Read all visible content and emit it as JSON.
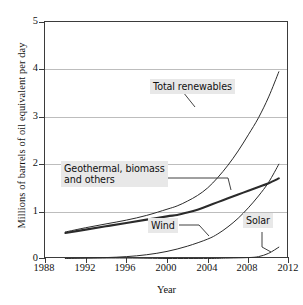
{
  "chart_data": {
    "type": "line",
    "title": "",
    "xlabel": "Year",
    "ylabel": "Millions of barrels of oil equivalent per day",
    "xlim": [
      1988,
      2012
    ],
    "ylim": [
      0,
      5
    ],
    "xticks": [
      1988,
      1992,
      1996,
      2000,
      2004,
      2008,
      2012
    ],
    "yticks": [
      0,
      1,
      2,
      3,
      4,
      5
    ],
    "grid": "horizontal",
    "legend": "inline-annotations",
    "series": [
      {
        "name": "Total renewables",
        "style": "thin",
        "x": [
          1990,
          1992,
          1994,
          1996,
          1998,
          2000,
          2001,
          2002,
          2003,
          2004,
          2005,
          2006,
          2007,
          2008,
          2009,
          2010,
          2011
        ],
        "values": [
          0.57,
          0.66,
          0.74,
          0.82,
          0.92,
          1.05,
          1.12,
          1.22,
          1.34,
          1.5,
          1.72,
          1.98,
          2.28,
          2.62,
          2.98,
          3.42,
          3.95
        ]
      },
      {
        "name": "Geothermal, biomass and others",
        "style": "thick",
        "x": [
          1990,
          1992,
          1994,
          1996,
          1998,
          2000,
          2001,
          2002,
          2003,
          2004,
          2005,
          2006,
          2007,
          2008,
          2009,
          2010,
          2011
        ],
        "values": [
          0.55,
          0.62,
          0.69,
          0.76,
          0.83,
          0.9,
          0.93,
          0.98,
          1.04,
          1.12,
          1.2,
          1.28,
          1.36,
          1.44,
          1.52,
          1.6,
          1.7
        ]
      },
      {
        "name": "Wind",
        "style": "thin",
        "x": [
          1990,
          1992,
          1994,
          1996,
          1998,
          2000,
          2002,
          2004,
          2005,
          2006,
          2007,
          2008,
          2009,
          2010,
          2011
        ],
        "values": [
          0.01,
          0.02,
          0.03,
          0.05,
          0.09,
          0.16,
          0.27,
          0.42,
          0.53,
          0.68,
          0.86,
          1.08,
          1.33,
          1.62,
          2.0
        ]
      },
      {
        "name": "Solar",
        "style": "thin",
        "x": [
          1990,
          1996,
          2000,
          2004,
          2006,
          2008,
          2009,
          2010,
          2011
        ],
        "values": [
          0.0,
          0.0,
          0.01,
          0.01,
          0.02,
          0.03,
          0.05,
          0.12,
          0.25
        ]
      }
    ],
    "annotations": [
      {
        "id": "total",
        "text": "Total renewables"
      },
      {
        "id": "geo",
        "text": "Geothermal, biomass\nand others"
      },
      {
        "id": "wind",
        "text": "Wind"
      },
      {
        "id": "solar",
        "text": "Solar"
      }
    ],
    "colors": {
      "axis": "#3b3b3b",
      "grid": "#bdbdbd",
      "line": "#2b2b2b",
      "label_background": "#e8e8e8",
      "text": "#111111",
      "background": "#ffffff"
    }
  }
}
